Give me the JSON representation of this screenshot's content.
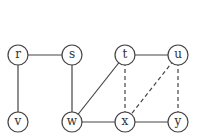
{
  "graph": {
    "node_radius": 10,
    "nodes": [
      {
        "id": "r",
        "label": "r",
        "x": 18,
        "y": 55
      },
      {
        "id": "s",
        "label": "s",
        "x": 72,
        "y": 55
      },
      {
        "id": "t",
        "label": "t",
        "x": 125,
        "y": 55
      },
      {
        "id": "u",
        "label": "u",
        "x": 178,
        "y": 55
      },
      {
        "id": "v",
        "label": "v",
        "x": 18,
        "y": 122
      },
      {
        "id": "w",
        "label": "w",
        "x": 72,
        "y": 122
      },
      {
        "id": "x",
        "label": "x",
        "x": 125,
        "y": 122
      },
      {
        "id": "y",
        "label": "y",
        "x": 178,
        "y": 122
      }
    ],
    "edges": [
      {
        "from": "r",
        "to": "s",
        "style": "solid"
      },
      {
        "from": "r",
        "to": "v",
        "style": "solid"
      },
      {
        "from": "s",
        "to": "w",
        "style": "solid"
      },
      {
        "from": "t",
        "to": "u",
        "style": "solid"
      },
      {
        "from": "t",
        "to": "w",
        "style": "solid"
      },
      {
        "from": "w",
        "to": "x",
        "style": "solid"
      },
      {
        "from": "x",
        "to": "y",
        "style": "solid"
      },
      {
        "from": "t",
        "to": "x",
        "style": "dashed"
      },
      {
        "from": "u",
        "to": "x",
        "style": "dashed"
      },
      {
        "from": "u",
        "to": "y",
        "style": "dashed"
      }
    ]
  }
}
